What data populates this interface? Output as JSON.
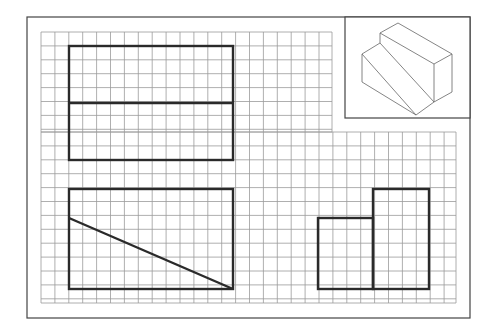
{
  "drawing": {
    "title": "Orthographic projection exercise",
    "grid": {
      "cell_px": 13.9,
      "upper": {
        "x0": 41,
        "y0": 32,
        "x1": 332,
        "y1": 132
      },
      "lower": {
        "x0": 41,
        "y0": 132,
        "x1": 456,
        "y1": 303
      },
      "color": "#9a9a9a"
    },
    "frame": {
      "x": 27,
      "y": 17,
      "w": 443,
      "h": 301,
      "color": "#444444"
    },
    "iso_box": {
      "x": 345,
      "y": 17,
      "w": 125,
      "h": 101
    },
    "views": {
      "top_view": {
        "x": 69,
        "y": 46,
        "w": 164,
        "h": 114,
        "midline_y": 103
      },
      "front_view": {
        "x": 69,
        "y": 189,
        "w": 164,
        "h": 100,
        "diagonal": {
          "x1": 69,
          "y1": 218,
          "x2": 233,
          "y2": 289
        }
      },
      "side_view": {
        "left_rect": {
          "x": 318,
          "y": 218,
          "w": 55,
          "h": 71
        },
        "right_rect": {
          "x": 373,
          "y": 189,
          "w": 56,
          "h": 100
        }
      }
    },
    "line_color": "#2a2a2a"
  }
}
